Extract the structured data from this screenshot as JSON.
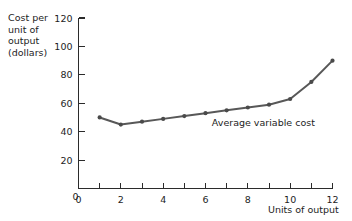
{
  "chart_data": {
    "type": "line",
    "title": "",
    "xlabel": "Units of output",
    "ylabel": "Cost per unit of output (dollars)",
    "ylabel_lines": [
      "Cost per",
      "unit of",
      "output",
      "(dollars)"
    ],
    "x": [
      1,
      2,
      3,
      4,
      5,
      6,
      7,
      8,
      9,
      10,
      11,
      12
    ],
    "series": [
      {
        "name": "Average variable cost",
        "values": [
          50,
          45,
          47,
          49,
          51,
          53,
          55,
          57,
          59,
          63,
          75,
          90
        ]
      }
    ],
    "annotations": [
      {
        "text": "Average variable cost",
        "x": 6.3,
        "y": 44
      }
    ],
    "xlim": [
      0,
      12
    ],
    "ylim": [
      0,
      120
    ],
    "x_ticks": [
      0,
      1,
      2,
      3,
      4,
      5,
      6,
      7,
      8,
      9,
      10,
      11,
      12
    ],
    "x_tick_labels": [
      "0",
      "",
      "2",
      "",
      "4",
      "",
      "6",
      "",
      "8",
      "",
      "10",
      "",
      "12"
    ],
    "y_ticks": [
      0,
      20,
      40,
      60,
      80,
      100,
      120
    ],
    "y_tick_labels": [
      "0",
      "20",
      "40",
      "60",
      "80",
      "100",
      "120"
    ],
    "grid": false,
    "legend": "none",
    "marker": "circle",
    "line_color": "#585858",
    "marker_color": "#4a4a4a",
    "axis_color": "#2b2b2b",
    "background_color": "#ffffff"
  }
}
